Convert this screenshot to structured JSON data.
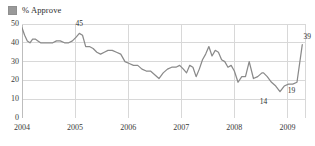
{
  "legend": {
    "swatch_name": "series-swatch",
    "label": "% Approve",
    "color": "#999999"
  },
  "axes": {
    "y_ticks": [
      "0",
      "10",
      "20",
      "30",
      "40",
      "50"
    ],
    "x_ticks": [
      "2004",
      "2005",
      "2006",
      "2007",
      "2008",
      "2009"
    ]
  },
  "annotations": [
    {
      "text": "45",
      "x": 2005.08,
      "y": 45,
      "dx": 0,
      "dy": -9
    },
    {
      "text": "39",
      "x": 2009.28,
      "y": 39,
      "dx": 5,
      "dy": -8
    },
    {
      "text": "19",
      "x": 2009.02,
      "y": 19,
      "dx": 3,
      "dy": 9
    },
    {
      "text": "14",
      "x": 2008.55,
      "y": 14,
      "dx": 0,
      "dy": 10
    }
  ],
  "style": {
    "line_color": "#8a8a8a",
    "grid_color": "#d8d8d8",
    "axis_color": "#bdbdbd",
    "background": "#ffffff"
  },
  "chart_data": {
    "type": "line",
    "title": "",
    "subtitle": "",
    "xlabel": "",
    "ylabel": "",
    "xlim": [
      2004,
      2009.35
    ],
    "ylim": [
      0,
      50
    ],
    "grid": true,
    "legend_position": "top-left",
    "series": [
      {
        "name": "% Approve",
        "color": "#8a8a8a",
        "x": [
          2004.0,
          2004.05,
          2004.1,
          2004.15,
          2004.2,
          2004.25,
          2004.3,
          2004.35,
          2004.42,
          2004.5,
          2004.58,
          2004.65,
          2004.72,
          2004.8,
          2004.88,
          2004.95,
          2005.02,
          2005.08,
          2005.14,
          2005.2,
          2005.27,
          2005.34,
          2005.41,
          2005.48,
          2005.55,
          2005.62,
          2005.7,
          2005.78,
          2005.86,
          2005.94,
          2006.02,
          2006.1,
          2006.18,
          2006.26,
          2006.34,
          2006.42,
          2006.5,
          2006.58,
          2006.66,
          2006.74,
          2006.82,
          2006.9,
          2006.97,
          2007.04,
          2007.1,
          2007.16,
          2007.22,
          2007.28,
          2007.34,
          2007.4,
          2007.46,
          2007.52,
          2007.58,
          2007.64,
          2007.7,
          2007.76,
          2007.82,
          2007.88,
          2007.94,
          2008.0,
          2008.07,
          2008.14,
          2008.21,
          2008.28,
          2008.36,
          2008.44,
          2008.52,
          2008.55,
          2008.62,
          2008.7,
          2008.78,
          2008.86,
          2008.94,
          2009.02,
          2009.1,
          2009.18,
          2009.28
        ],
        "y": [
          48,
          44,
          41,
          40,
          42,
          42,
          41,
          40,
          40,
          40,
          40,
          41,
          41,
          40,
          40,
          41,
          43,
          45,
          44,
          38,
          38,
          37,
          35,
          34,
          35,
          36,
          36,
          35,
          34,
          30,
          29,
          28,
          28,
          26,
          25,
          25,
          23,
          21,
          24,
          26,
          27,
          27,
          28,
          26,
          24,
          28,
          27,
          22,
          26,
          31,
          34,
          38,
          33,
          36,
          35,
          31,
          30,
          27,
          28,
          25,
          19,
          22,
          22,
          30,
          21,
          22,
          24,
          24,
          22,
          19,
          17,
          14,
          17,
          18,
          18,
          19,
          39
        ]
      }
    ]
  }
}
